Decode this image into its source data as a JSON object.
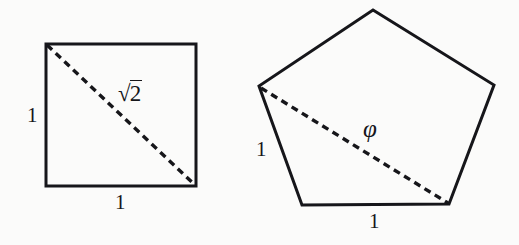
{
  "figure": {
    "caption_visible": false,
    "background_color": "#fbfbfa",
    "stroke_color": "#16161a",
    "shapes": [
      {
        "name": "unit-square",
        "type": "square",
        "side_length_label": "1",
        "vertices": [
          [
            46,
            44
          ],
          [
            196,
            44
          ],
          [
            196,
            186
          ],
          [
            46,
            186
          ]
        ],
        "diagonal": {
          "from": [
            46,
            44
          ],
          "to": [
            196,
            186
          ],
          "style": "dashed",
          "label": "√2",
          "label_radical_index": "",
          "label_radicand": "2"
        },
        "side_labels": [
          {
            "text": "1",
            "side": "left",
            "x": 30,
            "y": 105
          },
          {
            "text": "1",
            "side": "bottom",
            "x": 115,
            "y": 194
          }
        ]
      },
      {
        "name": "regular-pentagon",
        "type": "pentagon",
        "side_length_label": "1",
        "vertices": [
          [
            373,
            10
          ],
          [
            494,
            85
          ],
          [
            449,
            204
          ],
          [
            302,
            205
          ],
          [
            259,
            86
          ]
        ],
        "diagonal": {
          "from": [
            259,
            86
          ],
          "to": [
            449,
            204
          ],
          "style": "dashed",
          "label": "φ"
        },
        "side_labels": [
          {
            "text": "1",
            "side": "lower-left",
            "x": 258,
            "y": 140
          },
          {
            "text": "1",
            "side": "bottom",
            "x": 369,
            "y": 213
          }
        ]
      }
    ]
  },
  "labels": {
    "square_side_left": "1",
    "square_side_bottom": "1",
    "square_diagonal_radicand": "2",
    "pentagon_side_left": "1",
    "pentagon_side_bottom": "1",
    "pentagon_diagonal": "φ"
  }
}
